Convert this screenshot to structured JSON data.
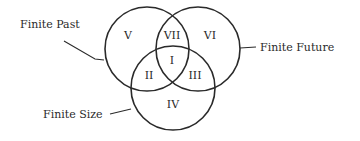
{
  "diagram": {
    "type": "venn",
    "sets": [
      {
        "id": "past",
        "label": "Finite Past",
        "cx": 147,
        "cy": 49,
        "r": 42
      },
      {
        "id": "future",
        "label": "Finite Future",
        "cx": 198,
        "cy": 49,
        "r": 42
      },
      {
        "id": "size",
        "label": "Finite Size",
        "cx": 173,
        "cy": 88,
        "r": 42
      }
    ],
    "regions": [
      {
        "id": "I",
        "label": "I",
        "sets": [
          "past",
          "future",
          "size"
        ]
      },
      {
        "id": "II",
        "label": "II",
        "sets": [
          "past",
          "size"
        ]
      },
      {
        "id": "III",
        "label": "III",
        "sets": [
          "future",
          "size"
        ]
      },
      {
        "id": "IV",
        "label": "IV",
        "sets": [
          "size"
        ]
      },
      {
        "id": "V",
        "label": "V",
        "sets": [
          "past"
        ]
      },
      {
        "id": "VI",
        "label": "VI",
        "sets": [
          "future"
        ]
      },
      {
        "id": "VII",
        "label": "VII",
        "sets": [
          "past",
          "future"
        ]
      }
    ],
    "stroke_color": "#2a2a2a",
    "background_color": "#ffffff"
  }
}
